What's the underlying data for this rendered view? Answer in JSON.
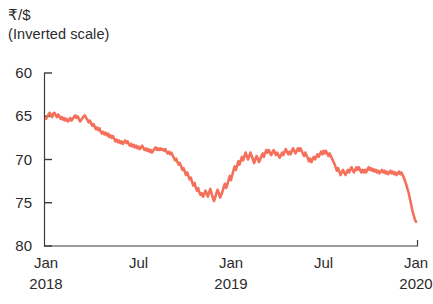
{
  "chart_data": {
    "type": "line",
    "title": "₹/$",
    "subtitle": "(Inverted scale)",
    "xlabel": "",
    "ylabel": "",
    "inverted_y": true,
    "grid": false,
    "legend": null,
    "line_color": "#f4705a",
    "axis_color": "#3b3b3b",
    "ylim": [
      60,
      80
    ],
    "yticks": [
      60,
      65,
      70,
      75,
      80
    ],
    "ytick_labels": [
      "60",
      "65",
      "70",
      "75",
      "80"
    ],
    "xticks": [
      0,
      0.25,
      0.5,
      0.75,
      1.0
    ],
    "xtick_labels": [
      "Jan",
      "Jul",
      "Jan",
      "Jul",
      "Jan"
    ],
    "xtick_years": [
      "2018",
      "",
      "2019",
      "",
      "2020"
    ],
    "xlim_start": "Jan 2018",
    "xlim_end": "Mar 2020",
    "series": [
      {
        "name": "Rupee per US dollar",
        "values": [
          65.3,
          65.1,
          64.8,
          64.6,
          64.9,
          65.1,
          64.7,
          64.6,
          64.9,
          65.1,
          64.8,
          65.0,
          65.3,
          65.1,
          65.4,
          65.2,
          65.5,
          65.3,
          65.6,
          65.4,
          65.2,
          65.5,
          65.3,
          65.1,
          64.9,
          65.2,
          65.0,
          65.3,
          65.6,
          65.4,
          65.2,
          65.0,
          64.9,
          65.2,
          65.4,
          65.7,
          65.5,
          65.8,
          66.1,
          65.9,
          66.2,
          66.5,
          66.3,
          66.6,
          66.4,
          66.8,
          67.0,
          66.8,
          67.1,
          66.9,
          67.2,
          67.0,
          67.4,
          67.2,
          67.5,
          67.3,
          67.6,
          67.9,
          67.7,
          68.0,
          67.8,
          68.1,
          67.9,
          68.2,
          68.0,
          67.8,
          68.1,
          67.9,
          68.2,
          68.4,
          68.2,
          68.5,
          68.3,
          68.6,
          68.4,
          68.7,
          68.5,
          68.8,
          68.6,
          68.4,
          68.7,
          68.9,
          68.7,
          69.0,
          68.8,
          69.1,
          68.9,
          69.2,
          69.0,
          68.8,
          68.6,
          68.9,
          68.7,
          68.9,
          68.7,
          68.9,
          68.8,
          69.0,
          68.8,
          69.1,
          69.3,
          69.1,
          69.4,
          69.2,
          69.5,
          69.8,
          70.1,
          69.9,
          70.3,
          70.6,
          70.4,
          70.8,
          71.2,
          71.0,
          71.4,
          71.8,
          71.5,
          71.9,
          72.3,
          72.1,
          72.6,
          73.0,
          72.7,
          73.2,
          73.6,
          73.3,
          73.8,
          74.1,
          73.9,
          74.3,
          74.0,
          73.6,
          73.9,
          74.3,
          73.8,
          73.4,
          73.9,
          74.4,
          74.8,
          74.4,
          73.9,
          73.5,
          73.9,
          74.4,
          74.1,
          73.7,
          73.2,
          72.8,
          73.3,
          72.9,
          72.4,
          71.9,
          72.4,
          71.8,
          71.3,
          70.8,
          71.2,
          70.7,
          70.2,
          70.6,
          70.1,
          69.7,
          70.1,
          69.6,
          69.2,
          69.6,
          70.0,
          69.6,
          69.2,
          69.6,
          70.0,
          70.4,
          70.0,
          69.6,
          69.9,
          70.3,
          70.0,
          69.6,
          69.3,
          69.7,
          69.3,
          68.9,
          69.2,
          68.9,
          69.2,
          69.5,
          69.2,
          68.9,
          69.2,
          69.5,
          69.2,
          69.5,
          69.8,
          69.5,
          69.2,
          69.5,
          69.1,
          68.8,
          69.1,
          69.4,
          69.1,
          69.4,
          69.0,
          68.7,
          69.0,
          69.3,
          69.0,
          68.7,
          69.0,
          68.7,
          69.0,
          69.3,
          69.6,
          69.2,
          69.5,
          69.8,
          70.2,
          69.9,
          70.3,
          70.0,
          69.7,
          70.0,
          69.7,
          69.4,
          69.7,
          69.4,
          69.1,
          69.4,
          69.0,
          69.3,
          69.0,
          69.3,
          69.6,
          69.3,
          69.6,
          69.9,
          70.2,
          70.5,
          70.9,
          71.3,
          71.0,
          71.4,
          71.8,
          71.5,
          71.2,
          71.5,
          71.8,
          71.5,
          71.2,
          71.5,
          71.2,
          70.9,
          71.2,
          71.5,
          71.2,
          70.9,
          71.2,
          70.9,
          71.2,
          71.5,
          71.2,
          71.5,
          71.2,
          71.5,
          71.2,
          70.9,
          71.2,
          71.0,
          71.3,
          71.1,
          71.4,
          71.2,
          71.5,
          71.3,
          71.6,
          71.4,
          71.2,
          71.5,
          71.3,
          71.6,
          71.4,
          71.7,
          71.5,
          71.3,
          71.6,
          71.4,
          71.7,
          71.5,
          71.8,
          71.6,
          71.4,
          71.7,
          71.5,
          71.8,
          72.1,
          72.5,
          72.9,
          73.4,
          73.9,
          74.5,
          75.2,
          75.9,
          76.4,
          76.9,
          77.2
        ]
      }
    ],
    "annotations": []
  },
  "axis": {
    "tick_mark_style": "short dash"
  }
}
